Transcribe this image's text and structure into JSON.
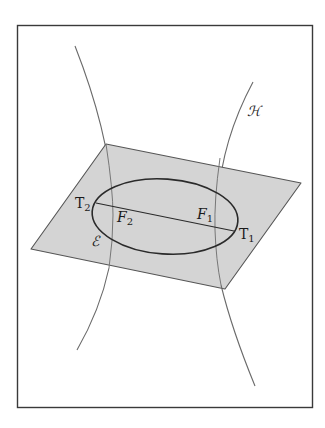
{
  "diagram": {
    "colors": {
      "frame": "#3a3a3a",
      "plane_fill": "#d4d4d4",
      "plane_edge": "#555555",
      "hyperbola": "#6a6a6a",
      "ellipse": "#2a2a2a"
    },
    "labels": {
      "hyperbola": "ℋ",
      "ellipse": "ℰ",
      "T1_main": "T",
      "T1_sub": "1",
      "T2_main": "T",
      "T2_sub": "2",
      "F1_main": "F",
      "F1_sub": "1",
      "F2_main": "F",
      "F2_sub": "2"
    },
    "elements": [
      {
        "name": "frame",
        "type": "rectangle"
      },
      {
        "name": "plane",
        "type": "parallelogram"
      },
      {
        "name": "hyperbola-left-branch",
        "type": "curve"
      },
      {
        "name": "hyperbola-right-branch",
        "type": "curve"
      },
      {
        "name": "ellipse",
        "type": "ellipse"
      },
      {
        "name": "major-axis",
        "type": "segment",
        "from": "T2",
        "to": "T1"
      }
    ]
  }
}
